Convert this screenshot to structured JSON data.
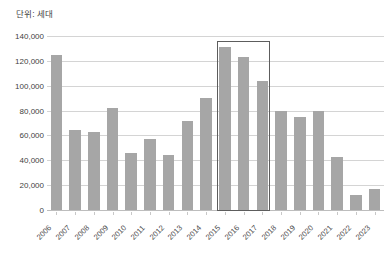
{
  "caption": "단위: 세대",
  "chart_data": {
    "type": "bar",
    "title": "",
    "subtitle": "",
    "xlabel": "",
    "ylabel": "",
    "unit_note": "단위: 세대",
    "categories": [
      "2006",
      "2007",
      "2008",
      "2009",
      "2010",
      "2011",
      "2012",
      "2013",
      "2014",
      "2015",
      "2016",
      "2017",
      "2018",
      "2019",
      "2020",
      "2021",
      "2022",
      "2023"
    ],
    "values": [
      125000,
      64000,
      63000,
      82000,
      46000,
      57000,
      44000,
      72000,
      90000,
      131000,
      123000,
      104000,
      80000,
      75000,
      80000,
      43000,
      12000,
      17000
    ],
    "series": [
      {
        "name": "세대수",
        "values": [
          125000,
          64000,
          63000,
          82000,
          46000,
          57000,
          44000,
          72000,
          90000,
          131000,
          123000,
          104000,
          80000,
          75000,
          80000,
          43000,
          12000,
          17000
        ]
      }
    ],
    "ylim": [
      0,
      140000
    ],
    "ytick_values": [
      0,
      20000,
      40000,
      60000,
      80000,
      100000,
      120000,
      140000
    ],
    "ytick_labels": [
      "0",
      "20,000",
      "40,000",
      "60,000",
      "80,000",
      "100,000",
      "120,000",
      "140,000"
    ],
    "grid": true,
    "legend": "none",
    "bar_color": "#a6a6a6",
    "gridline_color": "#d4d4d4",
    "annotations": [
      {
        "type": "highlight-rectangle",
        "label": "",
        "from_category": "2015",
        "to_category": "2017",
        "border_color": "#5d5d5d"
      }
    ]
  }
}
